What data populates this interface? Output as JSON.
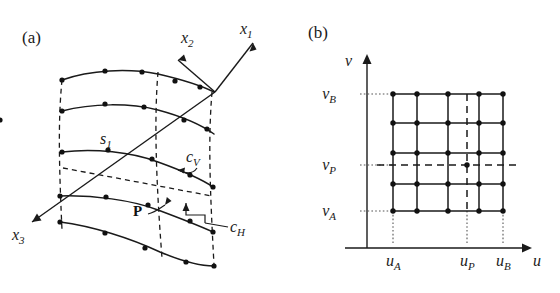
{
  "figure": {
    "panels": [
      {
        "id": "a",
        "label": "(a)",
        "caption_axes": [
          "x_1",
          "x_2",
          "x_3"
        ],
        "axes": [
          {
            "name": "x1-axis",
            "label_base": "x",
            "label_sub": "1",
            "direction": "up-right",
            "label_x": 243,
            "label_y": 34
          },
          {
            "name": "x2-axis",
            "label_base": "x",
            "label_sub": "2",
            "direction": "left",
            "label_x": 186,
            "label_y": 43
          },
          {
            "name": "x3-axis",
            "label_base": "x",
            "label_sub": "3",
            "direction": "down-left",
            "label_x": 14,
            "label_y": 238
          }
        ],
        "annotations": [
          {
            "name": "surface-label",
            "base": "s",
            "sub": "1",
            "x": 103,
            "y": 140
          },
          {
            "name": "cv-label",
            "base": "c",
            "sub": "V",
            "x": 190,
            "y": 163
          },
          {
            "name": "ch-label",
            "base": "c",
            "sub": "H",
            "x": 233,
            "y": 228
          },
          {
            "name": "point-p-label",
            "text": "P",
            "x": 140,
            "y": 211
          }
        ],
        "surface": {
          "description": "B-spline surface patch with control-point net",
          "curves": 5,
          "points_per_curve": 5
        }
      },
      {
        "id": "b",
        "label": "(b)",
        "axes": [
          {
            "name": "v-axis",
            "label_base": "ν",
            "label_sub": "",
            "orientation": "vertical",
            "label_x": 319,
            "label_y": 36
          },
          {
            "name": "u-axis",
            "label_base": "u",
            "label_sub": "",
            "orientation": "horizontal",
            "label_x": 536,
            "label_y": 264
          }
        ],
        "y_ticks": [
          {
            "name": "tick-vB",
            "base": "ν",
            "sub": "B",
            "y": 94
          },
          {
            "name": "tick-vP",
            "base": "ν",
            "sub": "P",
            "y": 165
          },
          {
            "name": "tick-vA",
            "base": "ν",
            "sub": "A",
            "y": 211
          }
        ],
        "x_ticks": [
          {
            "name": "tick-uA",
            "base": "u",
            "sub": "A",
            "x": 393
          },
          {
            "name": "tick-uP",
            "base": "u",
            "sub": "P",
            "x": 467
          },
          {
            "name": "tick-uB",
            "base": "u",
            "sub": "B",
            "x": 503
          }
        ],
        "grid": {
          "columns": 5,
          "rows": 5,
          "x_positions": [
            393,
            417,
            448,
            479,
            503
          ],
          "y_positions": [
            94,
            123,
            153,
            184,
            211
          ],
          "param_point": {
            "name": "parameter-point-P",
            "u": 467,
            "v": 165
          }
        }
      }
    ]
  },
  "colors": {
    "ink": "#1a1a1a",
    "background": "#ffffff",
    "dot_guide": "#555555"
  }
}
